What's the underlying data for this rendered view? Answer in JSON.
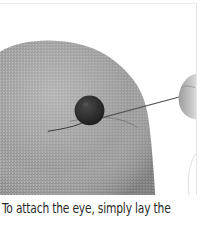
{
  "figure": {
    "elements": [
      "burlap-fabric",
      "bead-eye",
      "needle",
      "thread",
      "hand-fingertip"
    ],
    "colors": {
      "background": "#ffffff",
      "fabric": "#9a9a9a",
      "fabric_light": "#c4c4c4",
      "fabric_dark": "#7a7a7a",
      "bead": "#2c2c2c",
      "needle": "#555555",
      "hand": "#bdbdbd",
      "border": "#e6e6e6",
      "caption_text": "#2a2a2a"
    }
  },
  "caption": {
    "text": "To attach the eye, simply lay the"
  }
}
